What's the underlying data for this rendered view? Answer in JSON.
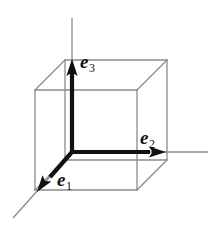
{
  "figure": {
    "background_color": "#ffffff",
    "cube_line_color": "#8a8a8a",
    "axis_line_color": "#8a8a8a",
    "vector_color": "#111111",
    "label_color": "#111111",
    "cube": {
      "front_face": {
        "left": 35,
        "top": 90,
        "right": 137,
        "bottom": 190
      },
      "depth_offset": {
        "dx": 30,
        "dy": -30
      }
    },
    "origin": {
      "x": 72,
      "y": 152
    },
    "vectors": [
      {
        "name": "e1",
        "label": "e",
        "subscript": "1",
        "direction": "down-left",
        "tip": {
          "x": 37,
          "y": 192
        }
      },
      {
        "name": "e2",
        "label": "e",
        "subscript": "2",
        "direction": "right",
        "tip": {
          "x": 165,
          "y": 152
        }
      },
      {
        "name": "e3",
        "label": "e",
        "subscript": "3",
        "direction": "up",
        "tip": {
          "x": 72,
          "y": 60
        }
      }
    ],
    "axes": [
      {
        "name": "axis-e1",
        "from": {
          "x": 72,
          "y": 152
        },
        "to": {
          "x": 13,
          "y": 218
        }
      },
      {
        "name": "axis-e2",
        "from": {
          "x": 72,
          "y": 152
        },
        "to": {
          "x": 208,
          "y": 152
        }
      },
      {
        "name": "axis-e3",
        "from": {
          "x": 72,
          "y": 152
        },
        "to": {
          "x": 72,
          "y": 18
        }
      }
    ]
  }
}
